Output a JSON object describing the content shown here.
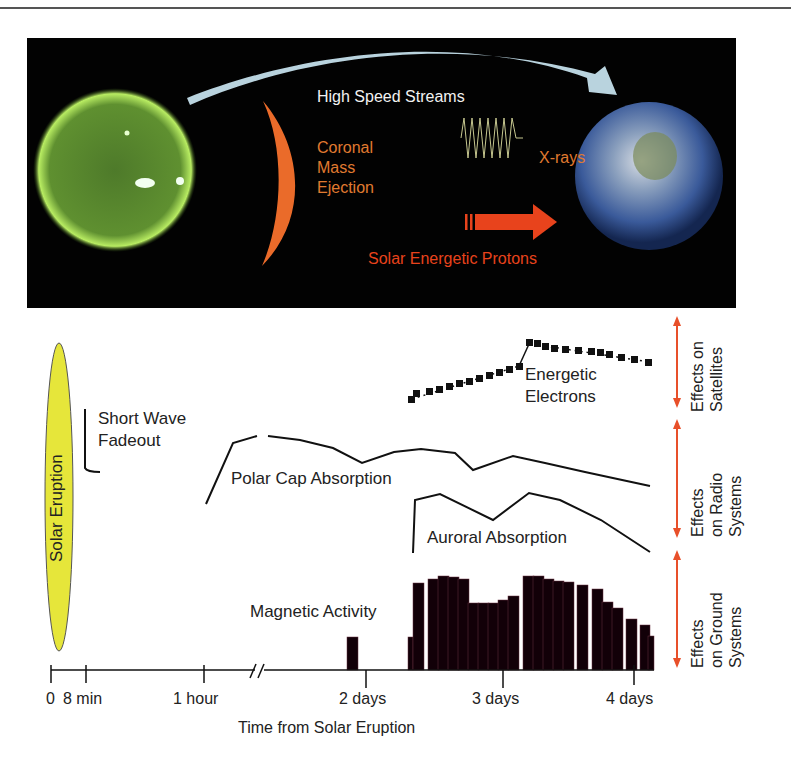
{
  "top_panel": {
    "high_speed_streams": "High Speed Streams",
    "cme_lines": [
      "Coronal",
      "Mass",
      "Ejection"
    ],
    "xrays": "X-rays",
    "protons": "Solar Energetic Protons",
    "colors": {
      "background": "#020202",
      "stream_arrow": "#b9d3de",
      "cme": "#ea6b2a",
      "cme_text": "#e07a30",
      "xray_text": "#e07a30",
      "protons": "#e8431c",
      "sun": "#6aa232",
      "earth": "#2f4f8e"
    }
  },
  "timeline": {
    "solar_eruption": "Solar Eruption",
    "short_wave_lines": [
      "Short Wave",
      "Fadeout"
    ],
    "polar_cap": "Polar Cap Absorption",
    "auroral": "Auroral Absorption",
    "energetic_lines": [
      "Energetic",
      "Electrons"
    ],
    "magnetic": "Magnetic Activity",
    "ticks": [
      "0",
      "8 min",
      "1 hour",
      "2 days",
      "3 days",
      "4 days"
    ],
    "axis_title": "Time from Solar Eruption",
    "effects": {
      "satellites": [
        "Effects on",
        "Satellites"
      ],
      "radio": [
        "Effects",
        "on Radio",
        "Systems"
      ],
      "ground": [
        "Effects",
        "on Ground",
        "Systems"
      ]
    },
    "colors": {
      "eruption_fill": "#e6e63a",
      "effect_arrow": "#e8502a",
      "line": "#111111",
      "bar": "#120008"
    }
  }
}
